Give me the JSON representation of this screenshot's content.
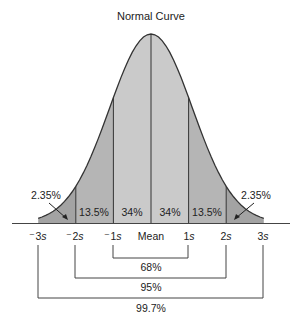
{
  "title": "Normal Curve",
  "colors": {
    "curve_fill_center": "#c8c8c8",
    "curve_fill_mid": "#b3b3b3",
    "curve_fill_tail": "#a0a0a0",
    "stroke": "#333333",
    "background": "#ffffff"
  },
  "chart_data": {
    "type": "area",
    "title": "Normal Curve",
    "distribution": "normal",
    "axis_ticks": [
      {
        "label": "⁻3",
        "unit": "s",
        "z": -3
      },
      {
        "label": "⁻2",
        "unit": "s",
        "z": -2
      },
      {
        "label": "⁻1",
        "unit": "s",
        "z": -1
      },
      {
        "label": "Mean",
        "unit": "",
        "z": 0
      },
      {
        "label": "1",
        "unit": "s",
        "z": 1
      },
      {
        "label": "2",
        "unit": "s",
        "z": 2
      },
      {
        "label": "3",
        "unit": "s",
        "z": 3
      }
    ],
    "regions": [
      {
        "from": -3,
        "to": -2,
        "percent": "2.35%"
      },
      {
        "from": -2,
        "to": -1,
        "percent": "13.5%"
      },
      {
        "from": -1,
        "to": 0,
        "percent": "34%"
      },
      {
        "from": 0,
        "to": 1,
        "percent": "34%"
      },
      {
        "from": 1,
        "to": 2,
        "percent": "13.5%"
      },
      {
        "from": 2,
        "to": 3,
        "percent": "2.35%"
      }
    ],
    "brackets": [
      {
        "from": -1,
        "to": 1,
        "percent": "68%"
      },
      {
        "from": -2,
        "to": 2,
        "percent": "95%"
      },
      {
        "from": -3,
        "to": 3,
        "percent": "99.7%"
      }
    ]
  },
  "labels": {
    "tail_left": "2.35%",
    "tail_right": "2.35%",
    "region_m2_m1": "13.5%",
    "region_m1_0": "34%",
    "region_0_1": "34%",
    "region_1_2": "13.5%",
    "tick_m3": "⁻3",
    "tick_m2": "⁻2",
    "tick_m1": "⁻1",
    "tick_mean": "Mean",
    "tick_1": "1",
    "tick_2": "2",
    "tick_3": "3",
    "unit": "s",
    "bracket_68": "68%",
    "bracket_95": "95%",
    "bracket_997": "99.7%"
  }
}
